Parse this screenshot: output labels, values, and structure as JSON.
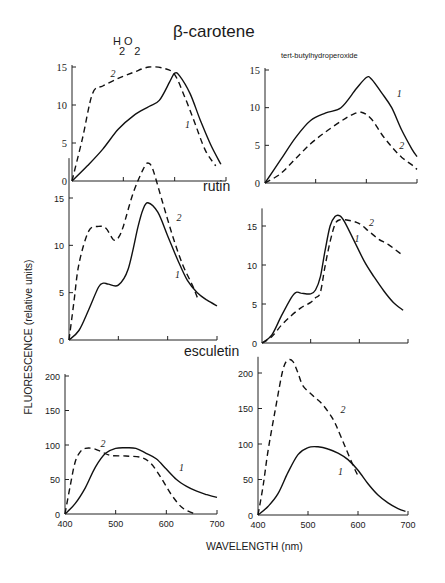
{
  "titles": {
    "beta_carotene": "β-carotene",
    "rutin": "rutin",
    "esculetin": "esculetin",
    "h2o2_main": "H O",
    "h2o2_sub": "2 2",
    "tbhp": "tert-butylhydroperoxide"
  },
  "axis_labels": {
    "y": "FLUORESCENCE (relative units)",
    "x": "WAVELENGTH (nm)"
  },
  "chart_data": [
    {
      "type": "line",
      "title": "β-carotene, H2O2",
      "xlabel": "WAVELENGTH (nm)",
      "ylabel": "FLUORESCENCE (relative units)",
      "xlim": [
        400,
        700
      ],
      "ylim": [
        0,
        15
      ],
      "yticks": [
        0,
        5,
        10,
        15
      ],
      "xticks": [
        400,
        500,
        600,
        700
      ],
      "xtick_labels_shown": false,
      "frame": {
        "x0": 72,
        "y0": 181,
        "x1": 226,
        "ymax_px": 67
      },
      "curve_labels": [
        {
          "text": "1",
          "x": 620,
          "y": 7.5
        },
        {
          "text": "2",
          "x": 475,
          "y": 14.2
        }
      ],
      "series": [
        {
          "name": "1",
          "style": "solid",
          "x": [
            400,
            430,
            460,
            490,
            520,
            550,
            570,
            590,
            600,
            610,
            630,
            650,
            670,
            690
          ],
          "y": [
            0,
            2.0,
            4.2,
            6.8,
            8.6,
            9.8,
            10.6,
            13.0,
            14.2,
            13.8,
            11.5,
            8.0,
            4.8,
            2.2
          ]
        },
        {
          "name": "2",
          "style": "dashed",
          "x": [
            400,
            420,
            440,
            460,
            490,
            520,
            550,
            580,
            600,
            620,
            640,
            660,
            680
          ],
          "y": [
            0,
            5.5,
            11.5,
            12.5,
            13.5,
            14.3,
            15.0,
            14.8,
            14.0,
            11.0,
            7.5,
            4.0,
            2.0
          ]
        }
      ]
    },
    {
      "type": "line",
      "title": "β-carotene, tert-butylhydroperoxide",
      "xlabel": "WAVELENGTH (nm)",
      "ylabel": "FLUORESCENCE (relative units)",
      "xlim": [
        400,
        700
      ],
      "ylim": [
        0,
        15
      ],
      "yticks": [
        0,
        5,
        10,
        15
      ],
      "xticks": [
        400,
        500,
        600,
        700
      ],
      "xtick_labels_shown": false,
      "frame": {
        "x0": 265,
        "y0": 183,
        "x1": 417,
        "ymax_px": 70
      },
      "curve_labels": [
        {
          "text": "1",
          "x": 660,
          "y": 12.0
        },
        {
          "text": "2",
          "x": 665,
          "y": 5.0
        }
      ],
      "series": [
        {
          "name": "1",
          "style": "solid",
          "x": [
            400,
            430,
            460,
            490,
            520,
            550,
            580,
            600,
            610,
            630,
            650,
            670,
            690,
            700
          ],
          "y": [
            0,
            3.0,
            6.0,
            8.3,
            9.3,
            10.0,
            12.5,
            14.0,
            13.8,
            12.0,
            10.0,
            7.0,
            4.5,
            3.5
          ]
        },
        {
          "name": "2",
          "style": "dashed",
          "x": [
            400,
            430,
            460,
            490,
            520,
            550,
            570,
            590,
            610,
            630,
            650,
            670,
            690,
            700
          ],
          "y": [
            0,
            1.2,
            3.2,
            5.2,
            6.8,
            8.2,
            9.0,
            9.4,
            8.5,
            6.5,
            4.8,
            3.4,
            2.4,
            1.8
          ]
        }
      ]
    },
    {
      "type": "line",
      "title": "rutin, H2O2",
      "xlabel": "WAVELENGTH (nm)",
      "ylabel": "FLUORESCENCE (relative units)",
      "xlim": [
        400,
        700
      ],
      "ylim": [
        0,
        19
      ],
      "yticks": [
        0,
        5,
        10,
        15
      ],
      "xticks": [
        400,
        500,
        600,
        700
      ],
      "xtick_labels_shown": false,
      "frame": {
        "x0": 69,
        "y0": 340,
        "x1": 217,
        "ymax_px": 198
      },
      "curve_labels": [
        {
          "text": "1",
          "x": 615,
          "y": 7.0
        },
        {
          "text": "2",
          "x": 618,
          "y": 13.0
        }
      ],
      "series": [
        {
          "name": "1",
          "style": "solid",
          "x": [
            400,
            420,
            440,
            460,
            470,
            480,
            500,
            520,
            540,
            550,
            560,
            580,
            600,
            620,
            640,
            660,
            680,
            700
          ],
          "y": [
            0,
            1.0,
            3.2,
            5.6,
            6.0,
            5.9,
            5.8,
            7.5,
            12.0,
            13.8,
            14.5,
            13.5,
            11.0,
            8.5,
            6.3,
            5.0,
            4.2,
            3.6
          ]
        },
        {
          "name": "2",
          "style": "dashed",
          "x": [
            400,
            410,
            420,
            440,
            460,
            475,
            490,
            500,
            510,
            530,
            550,
            560,
            570,
            590,
            610,
            630,
            650,
            660
          ],
          "y": [
            0,
            4.0,
            8.0,
            11.5,
            12.0,
            11.8,
            10.6,
            10.8,
            12.0,
            15.5,
            18.0,
            18.7,
            18.0,
            14.5,
            11.0,
            8.0,
            5.8,
            4.5
          ]
        }
      ]
    },
    {
      "type": "line",
      "title": "rutin, tert-butylhydroperoxide",
      "xlabel": "WAVELENGTH (nm)",
      "ylabel": "FLUORESCENCE (relative units)",
      "xlim": [
        400,
        700
      ],
      "ylim": [
        0,
        17
      ],
      "yticks": [
        0,
        5,
        10,
        15
      ],
      "xticks": [
        400,
        500,
        600,
        700
      ],
      "xtick_labels_shown": false,
      "frame": {
        "x0": 262,
        "y0": 343,
        "x1": 408,
        "ymax_px": 226
      },
      "curve_labels": [
        {
          "text": "1",
          "x": 590,
          "y": 13.5
        },
        {
          "text": "2",
          "x": 620,
          "y": 15.5
        }
      ],
      "series": [
        {
          "name": "1",
          "style": "solid",
          "x": [
            400,
            420,
            440,
            460,
            470,
            480,
            500,
            510,
            520,
            530,
            540,
            550,
            560,
            570,
            590,
            610,
            630,
            650,
            670,
            690
          ],
          "y": [
            0,
            1.0,
            3.5,
            5.8,
            6.5,
            6.4,
            6.3,
            6.8,
            8.5,
            12.0,
            15.0,
            16.2,
            16.3,
            15.5,
            13.0,
            10.5,
            8.5,
            6.7,
            5.2,
            4.2
          ]
        },
        {
          "name": "2",
          "style": "dashed",
          "x": [
            400,
            420,
            440,
            460,
            480,
            500,
            510,
            520,
            530,
            540,
            550,
            560,
            580,
            600,
            620,
            640,
            660,
            690
          ],
          "y": [
            0,
            0.8,
            2.3,
            3.5,
            4.5,
            5.2,
            5.8,
            6.5,
            10.0,
            13.0,
            15.2,
            15.8,
            15.7,
            15.3,
            14.3,
            13.3,
            12.6,
            11.2
          ]
        }
      ]
    },
    {
      "type": "line",
      "title": "esculetin, H2O2",
      "xlabel": "WAVELENGTH (nm)",
      "ylabel": "FLUORESCENCE (relative units)",
      "xlim": [
        400,
        700
      ],
      "ylim": [
        0,
        200
      ],
      "yticks": [
        0,
        50,
        100,
        150,
        200
      ],
      "xticks": [
        400,
        500,
        600,
        700
      ],
      "xtick_labels": [
        "400",
        "500",
        "600",
        "700"
      ],
      "frame": {
        "x0": 65,
        "y0": 514,
        "x1": 217,
        "ymax_px": 376
      },
      "curve_labels": [
        {
          "text": "1",
          "x": 625,
          "y": 68
        },
        {
          "text": "2",
          "x": 470,
          "y": 103
        }
      ],
      "series": [
        {
          "name": "1",
          "style": "solid",
          "x": [
            400,
            420,
            440,
            460,
            480,
            500,
            520,
            540,
            560,
            580,
            600,
            620,
            640,
            660,
            680,
            700
          ],
          "y": [
            0,
            15,
            38,
            68,
            88,
            95,
            96,
            95,
            88,
            80,
            65,
            50,
            40,
            33,
            28,
            24
          ]
        },
        {
          "name": "2",
          "style": "dashed",
          "x": [
            400,
            410,
            420,
            430,
            440,
            455,
            470,
            490,
            520,
            550,
            570,
            590,
            610,
            630,
            650,
            660
          ],
          "y": [
            0,
            40,
            75,
            90,
            95,
            95,
            91,
            85,
            84,
            82,
            73,
            52,
            28,
            10,
            2,
            0
          ]
        }
      ]
    },
    {
      "type": "line",
      "title": "esculetin, tert-butylhydroperoxide",
      "xlabel": "WAVELENGTH (nm)",
      "ylabel": "FLUORESCENCE (relative units)",
      "xlim": [
        400,
        700
      ],
      "ylim": [
        0,
        220
      ],
      "yticks": [
        0,
        50,
        100,
        150,
        200
      ],
      "xticks": [
        400,
        500,
        600,
        700
      ],
      "xtick_labels": [
        "400",
        "500",
        "600",
        "700"
      ],
      "frame": {
        "x0": 258,
        "y0": 515,
        "x1": 408,
        "ymax_px": 373
      },
      "curve_labels": [
        {
          "text": "1",
          "x": 560,
          "y": 62
        },
        {
          "text": "2",
          "x": 565,
          "y": 150
        }
      ],
      "series": [
        {
          "name": "1",
          "style": "solid",
          "x": [
            400,
            420,
            440,
            460,
            480,
            500,
            520,
            540,
            560,
            580,
            600,
            620,
            640,
            660,
            680,
            695
          ],
          "y": [
            0,
            12,
            30,
            60,
            85,
            95,
            96,
            93,
            87,
            78,
            63,
            44,
            28,
            17,
            9,
            5
          ]
        },
        {
          "name": "2",
          "style": "dashed",
          "x": [
            400,
            410,
            420,
            435,
            450,
            460,
            470,
            480,
            490,
            510,
            530,
            550,
            560,
            575,
            590,
            600
          ],
          "y": [
            0,
            40,
            90,
            150,
            205,
            218,
            216,
            200,
            182,
            168,
            155,
            135,
            120,
            95,
            70,
            55
          ]
        }
      ]
    }
  ]
}
